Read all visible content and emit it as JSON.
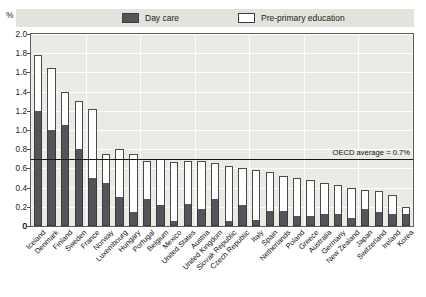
{
  "axis_unit": "%",
  "legend": {
    "items": [
      {
        "key": "day_care",
        "label": "Day care",
        "color": "#54545a"
      },
      {
        "key": "pre_primary",
        "label": "Pre-primary education",
        "color": "#ffffff"
      }
    ]
  },
  "annotation": {
    "oecd_average_label": "OECD average = 0.7%",
    "oecd_average_value": 0.7
  },
  "footnote": "",
  "chart_data": {
    "type": "bar",
    "stacked": true,
    "title": "",
    "subtitle": "",
    "xlabel": "",
    "ylabel": "%",
    "ylim": [
      0,
      2.0
    ],
    "ytick_values": [
      0,
      0.2,
      0.4,
      0.6,
      0.8,
      1.0,
      1.2,
      1.4,
      1.6,
      1.8,
      2.0
    ],
    "ytick_labels": [
      "0",
      "0.2",
      "0.4",
      "0.6",
      "0.8",
      "1.0",
      "1.2",
      "1.4",
      "1.6",
      "1.8",
      "2.0"
    ],
    "grid": true,
    "legend_position": "top",
    "categories": [
      "Iceland",
      "Denmark",
      "Finland",
      "Sweden",
      "France",
      "Norway",
      "Luxembourg",
      "Hungary",
      "Portugal",
      "Belgium",
      "Mexico",
      "United States",
      "Austria",
      "United Kingdom",
      "Slovak Republic",
      "Czech Republic",
      "Italy",
      "Spain",
      "Netherlands",
      "Poland",
      "Greece",
      "Australia",
      "Germany",
      "New Zealand",
      "Japan",
      "Switzerland",
      "Ireland",
      "Korea"
    ],
    "series": [
      {
        "name": "Day care",
        "color": "#54545a",
        "values": [
          1.2,
          1.0,
          1.05,
          0.8,
          0.5,
          0.45,
          0.3,
          0.15,
          0.28,
          0.22,
          0.05,
          0.23,
          0.18,
          0.28,
          0.05,
          0.22,
          0.06,
          0.16,
          0.16,
          0.1,
          0.1,
          0.12,
          0.13,
          0.08,
          0.18,
          0.15,
          0.12,
          0.12
        ]
      },
      {
        "name": "Pre-primary education",
        "color": "#ffffff",
        "values": [
          0.58,
          0.65,
          0.35,
          0.5,
          0.72,
          0.3,
          0.5,
          0.6,
          0.4,
          0.48,
          0.62,
          0.45,
          0.5,
          0.38,
          0.58,
          0.38,
          0.52,
          0.4,
          0.36,
          0.4,
          0.38,
          0.33,
          0.3,
          0.32,
          0.2,
          0.22,
          0.2,
          0.08
        ]
      }
    ],
    "totals": [
      1.78,
      1.65,
      1.4,
      1.3,
      1.22,
      0.75,
      0.8,
      0.75,
      0.68,
      0.7,
      0.67,
      0.68,
      0.68,
      0.66,
      0.63,
      0.6,
      0.58,
      0.56,
      0.52,
      0.5,
      0.48,
      0.45,
      0.43,
      0.4,
      0.38,
      0.37,
      0.32,
      0.2
    ]
  }
}
